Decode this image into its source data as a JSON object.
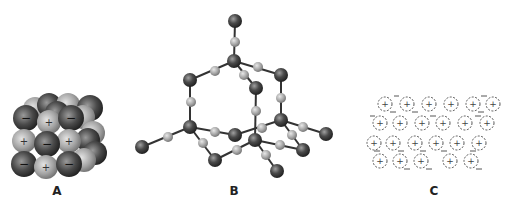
{
  "panels": [
    {
      "id": "A",
      "label": "A",
      "description": "Ionic crystal lattice of alternating + and − ions (space-filling)"
    },
    {
      "id": "B",
      "label": "B",
      "description": "Covalent network solid ball-and-stick structure"
    },
    {
      "id": "C",
      "label": "C",
      "description": "Metallic lattice of positive ions in a sea of electrons"
    }
  ],
  "symbols": {
    "plus": "+",
    "minus": "−",
    "electron": "−"
  },
  "colors": {
    "background": "#ffffff",
    "dark_sphere": "#3a3a3a",
    "light_sphere": "#9a9a9a",
    "bond": "#333333",
    "dashed_ion": "#555555",
    "label": "#222222"
  }
}
